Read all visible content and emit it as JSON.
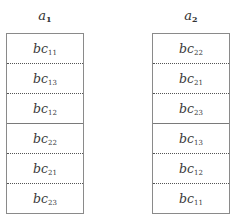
{
  "columns": [
    {
      "label": "a",
      "label_sub": "1",
      "cells": [
        {
          "base": "bc",
          "sub": "11",
          "separator_above": "none"
        },
        {
          "base": "bc",
          "sub": "13",
          "separator_above": "dotted"
        },
        {
          "base": "bc",
          "sub": "12",
          "separator_above": "dotted"
        },
        {
          "base": "bc",
          "sub": "22",
          "separator_above": "solid"
        },
        {
          "base": "bc",
          "sub": "21",
          "separator_above": "dotted"
        },
        {
          "base": "bc",
          "sub": "23",
          "separator_above": "dotted"
        }
      ]
    },
    {
      "label": "a",
      "label_sub": "2",
      "cells": [
        {
          "base": "bc",
          "sub": "22",
          "separator_above": "none"
        },
        {
          "base": "bc",
          "sub": "21",
          "separator_above": "dotted"
        },
        {
          "base": "bc",
          "sub": "23",
          "separator_above": "dotted"
        },
        {
          "base": "bc",
          "sub": "13",
          "separator_above": "solid"
        },
        {
          "base": "bc",
          "sub": "12",
          "separator_above": "dotted"
        },
        {
          "base": "bc",
          "sub": "11",
          "separator_above": "dotted"
        }
      ]
    }
  ]
}
